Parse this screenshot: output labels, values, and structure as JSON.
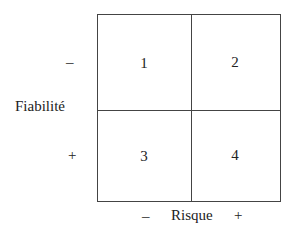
{
  "y_axis": {
    "label": "Fiabilité",
    "top_sign": "–",
    "bottom_sign": "+"
  },
  "x_axis": {
    "label": "Risque",
    "left_sign": "–",
    "right_sign": "+"
  },
  "quadrants": [
    "1",
    "2",
    "3",
    "4"
  ]
}
